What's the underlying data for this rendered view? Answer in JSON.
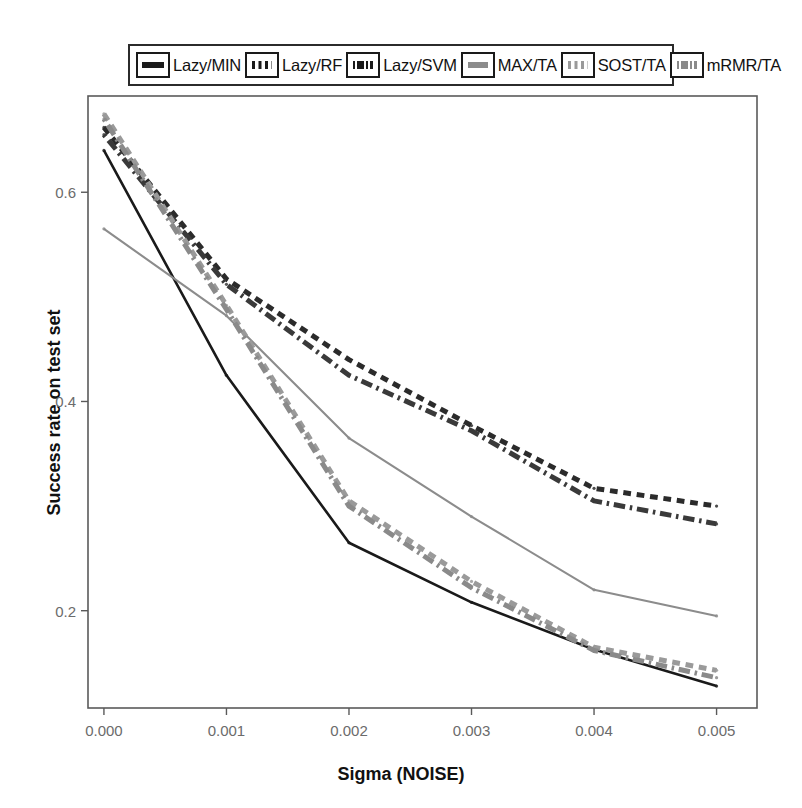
{
  "chart_data": {
    "type": "line",
    "title": "",
    "xlabel": "Sigma (NOISE)",
    "ylabel": "Success rate on test set",
    "x": [
      0.0,
      0.001,
      0.002,
      0.003,
      0.004,
      0.005
    ],
    "xticklabels": [
      "0.000",
      "0.001",
      "0.002",
      "0.003",
      "0.004",
      "0.005"
    ],
    "yticks": [
      0.2,
      0.4,
      0.6
    ],
    "yticklabels": [
      "0.2",
      "0.4",
      "0.6"
    ],
    "xlim": [
      -0.00013,
      0.00533
    ],
    "ylim": [
      0.107,
      0.692
    ],
    "grid": false,
    "legend_position": "top-outside",
    "series": [
      {
        "name": "Lazy/MIN",
        "values": [
          0.64,
          0.425,
          0.265,
          0.208,
          0.163,
          0.128
        ],
        "color": "#1a1a1a",
        "style": "solid",
        "width": 2.6
      },
      {
        "name": "Lazy/RF",
        "values": [
          0.662,
          0.517,
          0.44,
          0.377,
          0.317,
          0.3
        ],
        "color": "#2b2b2b",
        "style": "dashed",
        "width": 5
      },
      {
        "name": "Lazy/SVM",
        "values": [
          0.655,
          0.512,
          0.425,
          0.372,
          0.305,
          0.283
        ],
        "color": "#3a3a3a",
        "style": "dashdot",
        "width": 5
      },
      {
        "name": "MAX/TA",
        "values": [
          0.565,
          0.482,
          0.365,
          0.29,
          0.22,
          0.195
        ],
        "color": "#8c8c8c",
        "style": "solid",
        "width": 2.1
      },
      {
        "name": "SOST/TA",
        "values": [
          0.675,
          0.492,
          0.305,
          0.228,
          0.165,
          0.143
        ],
        "color": "#9a9a9a",
        "style": "dashed",
        "width": 5
      },
      {
        "name": "mRMR/TA",
        "values": [
          0.67,
          0.488,
          0.3,
          0.222,
          0.162,
          0.136
        ],
        "color": "#8a8a8a",
        "style": "dashdot",
        "width": 5
      }
    ]
  },
  "legend": {
    "entries": [
      {
        "label": "Lazy/MIN",
        "key": "solid-line-key"
      },
      {
        "label": "Lazy/RF",
        "key": "dashed-line-key"
      },
      {
        "label": "Lazy/SVM",
        "key": "dashdot-line-key"
      },
      {
        "label": "MAX/TA",
        "key": "gray-solid-line-key"
      },
      {
        "label": "SOST/TA",
        "key": "gray-dashed-line-key"
      },
      {
        "label": "mRMR/TA",
        "key": "gray-dashdot-line-key"
      }
    ]
  },
  "axes": {
    "x_title": "Sigma (NOISE)",
    "y_title": "Success rate on test set",
    "x_ticks": [
      "0.000",
      "0.001",
      "0.002",
      "0.003",
      "0.004",
      "0.005"
    ],
    "y_ticks": [
      "0.6",
      "0.4",
      "0.2"
    ]
  },
  "colors": {
    "frame": "#5a5a5a",
    "tick_text": "#6b6b6b",
    "title_text": "#111111",
    "background": "#ffffff"
  }
}
